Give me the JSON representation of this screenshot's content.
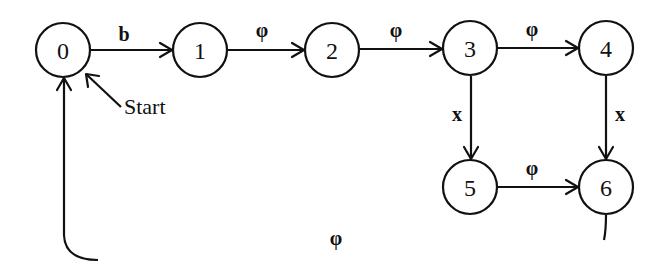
{
  "diagram": {
    "type": "state-transition-diagram",
    "start_label": "Start",
    "states": [
      {
        "id": "0",
        "label": "0"
      },
      {
        "id": "1",
        "label": "1"
      },
      {
        "id": "2",
        "label": "2"
      },
      {
        "id": "3",
        "label": "3"
      },
      {
        "id": "4",
        "label": "4"
      },
      {
        "id": "5",
        "label": "5"
      },
      {
        "id": "6",
        "label": "6"
      }
    ],
    "transitions": [
      {
        "from": "0",
        "to": "1",
        "label": "b"
      },
      {
        "from": "1",
        "to": "2",
        "label": "φ"
      },
      {
        "from": "2",
        "to": "3",
        "label": "φ"
      },
      {
        "from": "3",
        "to": "4",
        "label": "φ"
      },
      {
        "from": "3",
        "to": "5",
        "label": "x"
      },
      {
        "from": "4",
        "to": "6",
        "label": "x"
      },
      {
        "from": "5",
        "to": "6",
        "label": "φ"
      },
      {
        "from": "6",
        "to": "0",
        "label": "φ"
      }
    ]
  }
}
